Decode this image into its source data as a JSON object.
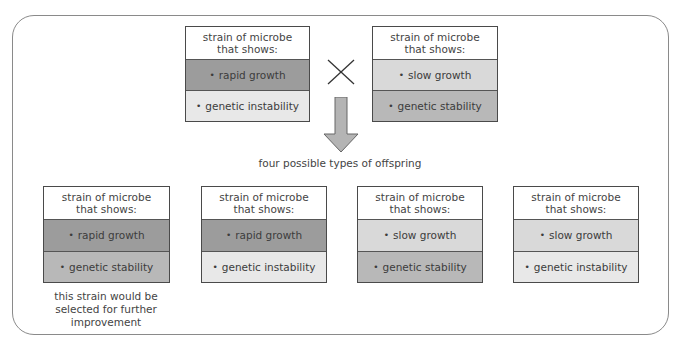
{
  "colors": {
    "frame_border": "#8a8a8a",
    "rapid_growth": "#9c9c9c",
    "slow_growth": "#d9d9d9",
    "genetic_stability": "#b8b8b8",
    "genetic_instability": "#e8e8e8",
    "arrow_fill": "#b4b4b4"
  },
  "parents": [
    {
      "header": "strain of microbe that shows:",
      "trait1": "rapid growth",
      "trait2": "genetic instability"
    },
    {
      "header": "strain of microbe that shows:",
      "trait1": "slow growth",
      "trait2": "genetic stability"
    }
  ],
  "cross_symbol": "×",
  "offspring_label": "four possible types of offspring",
  "offspring": [
    {
      "header": "strain of microbe that shows:",
      "trait1": "rapid growth",
      "trait2": "genetic stability"
    },
    {
      "header": "strain of microbe that shows:",
      "trait1": "rapid growth",
      "trait2": "genetic instability"
    },
    {
      "header": "strain of microbe that shows:",
      "trait1": "slow growth",
      "trait2": "genetic stability"
    },
    {
      "header": "strain of microbe that shows:",
      "trait1": "slow growth",
      "trait2": "genetic instability"
    }
  ],
  "bullet": "•",
  "selection_note": "this strain would be selected for further improvement"
}
